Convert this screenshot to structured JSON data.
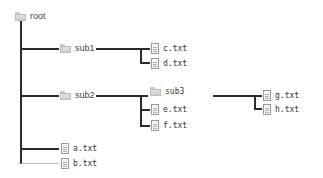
{
  "tree": {
    "root": {
      "label": "root",
      "icon": "folder-icon"
    },
    "sub1": {
      "label": "sub1",
      "icon": "folder-icon",
      "children": [
        {
          "label": "c.txt",
          "icon": "file-icon"
        },
        {
          "label": "d.txt",
          "icon": "file-icon"
        }
      ]
    },
    "sub2": {
      "label": "sub2",
      "icon": "folder-icon",
      "children": [
        {
          "label": "sub3",
          "icon": "folder-icon"
        },
        {
          "label": "e.txt",
          "icon": "file-icon"
        },
        {
          "label": "f.txt",
          "icon": "file-icon"
        }
      ]
    },
    "sub3": {
      "label": "sub3",
      "icon": "folder-icon",
      "children": [
        {
          "label": "g.txt",
          "icon": "file-icon"
        },
        {
          "label": "h.txt",
          "icon": "file-icon"
        }
      ]
    },
    "root_files": [
      {
        "label": "a.txt",
        "icon": "file-icon"
      },
      {
        "label": "b.txt",
        "icon": "file-icon"
      }
    ]
  },
  "colors": {
    "line": "#2b2b2b",
    "text": "#333333",
    "folder": "#d6d6d6"
  }
}
